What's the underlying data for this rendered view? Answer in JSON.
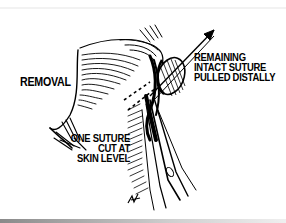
{
  "figure": {
    "type": "medical line illustration",
    "labels": {
      "removal": "REMOVAL",
      "remaining": [
        "REMAINING",
        "INTACT SUTURE",
        "PULLED DISTALLY"
      ],
      "one_suture": [
        "ONE SUTURE",
        "CUT AT",
        "SKIN LEVEL"
      ]
    },
    "signature": "GK",
    "elements": [
      "skin-fold-icon",
      "suture-knot-icon",
      "scissors-icon",
      "pull-arrow-icon",
      "cut-line-icon"
    ],
    "colors": {
      "ink": "#000000",
      "paper": "#ffffff"
    }
  }
}
